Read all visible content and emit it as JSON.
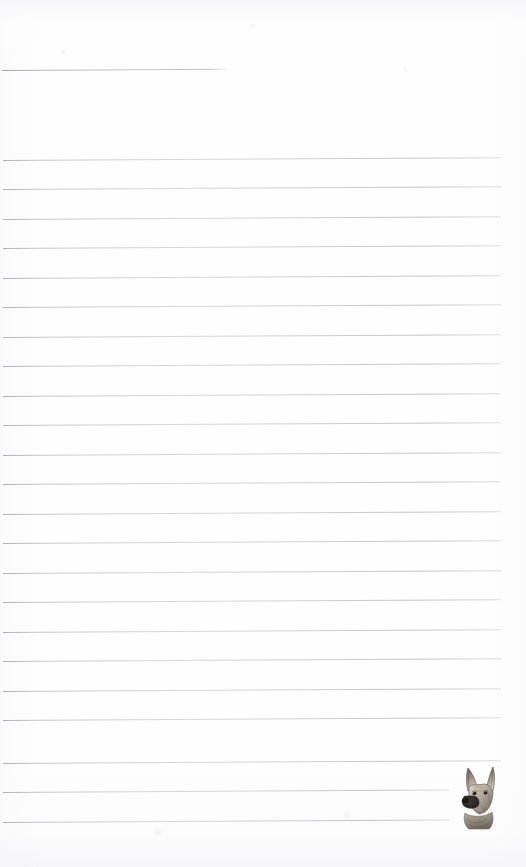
{
  "page": {
    "kind": "lined-notepad-scan",
    "width": 526,
    "height": 867,
    "background_color": "#fefefe",
    "paper_tint_color": "#f6f6f8"
  },
  "rules": {
    "line_color": "#a4a6ac",
    "spacing_px": 29.5,
    "left_margin_px": 3,
    "right_edge_px": 501,
    "tilt_deg": -0.33,
    "header_line": {
      "name": "header-rule",
      "y": 70,
      "x_start": 2,
      "x_end": 226
    },
    "body_lines": [
      {
        "y": 160,
        "x_start": 3,
        "x_end": 501
      },
      {
        "y": 189,
        "x_start": 3,
        "x_end": 501
      },
      {
        "y": 219,
        "x_start": 3,
        "x_end": 501
      },
      {
        "y": 248,
        "x_start": 3,
        "x_end": 501
      },
      {
        "y": 278,
        "x_start": 3,
        "x_end": 501
      },
      {
        "y": 307,
        "x_start": 3,
        "x_end": 501
      },
      {
        "y": 337,
        "x_start": 3,
        "x_end": 501
      },
      {
        "y": 366,
        "x_start": 3,
        "x_end": 501
      },
      {
        "y": 396,
        "x_start": 3,
        "x_end": 501
      },
      {
        "y": 425,
        "x_start": 3,
        "x_end": 501
      },
      {
        "y": 455,
        "x_start": 3,
        "x_end": 501
      },
      {
        "y": 484,
        "x_start": 3,
        "x_end": 501
      },
      {
        "y": 514,
        "x_start": 3,
        "x_end": 501
      },
      {
        "y": 543,
        "x_start": 3,
        "x_end": 501
      },
      {
        "y": 573,
        "x_start": 3,
        "x_end": 501
      },
      {
        "y": 602,
        "x_start": 3,
        "x_end": 501
      },
      {
        "y": 632,
        "x_start": 3,
        "x_end": 501
      },
      {
        "y": 661,
        "x_start": 3,
        "x_end": 501
      },
      {
        "y": 691,
        "x_start": 3,
        "x_end": 501
      },
      {
        "y": 720,
        "x_start": 3,
        "x_end": 501
      },
      {
        "y": 763,
        "x_start": 3,
        "x_end": 501
      },
      {
        "y": 792,
        "x_start": 3,
        "x_end": 449
      },
      {
        "y": 822,
        "x_start": 3,
        "x_end": 449
      }
    ]
  },
  "illustration": {
    "name": "german-shepherd-head",
    "description": "Pencil sketch of a German Shepherd dog head, ears erect, facing forward-left",
    "x": 455,
    "y": 763,
    "width": 46,
    "height": 68,
    "ink_color": "#4a4642",
    "fur_light": "#d9d2c8",
    "fur_mid": "#a59a8c",
    "fur_dark": "#5d564e",
    "muzzle_color": "#2e2b28"
  }
}
